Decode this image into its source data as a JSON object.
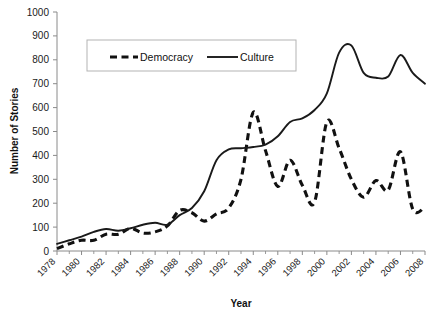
{
  "chart_data": {
    "type": "line",
    "title": "",
    "xlabel": "Year",
    "ylabel": "Number of Stories",
    "xlim": [
      1978,
      2008
    ],
    "ylim": [
      0,
      1000
    ],
    "ytick_step": 100,
    "xtick_step": 2,
    "minor_xtick_step": 1,
    "grid": false,
    "legend_position": "top-center",
    "yticks": [
      "1000",
      "900",
      "800",
      "700",
      "600",
      "500",
      "400",
      "300",
      "200",
      "100",
      "0"
    ],
    "xticks": [
      "1978",
      "1980",
      "1982",
      "1984",
      "1986",
      "1988",
      "1990",
      "1992",
      "1994",
      "1996",
      "1998",
      "2000",
      "2002",
      "2004",
      "2006",
      "2008"
    ],
    "x": [
      1978,
      1979,
      1980,
      1981,
      1982,
      1983,
      1984,
      1985,
      1986,
      1987,
      1988,
      1989,
      1990,
      1991,
      1992,
      1993,
      1994,
      1995,
      1996,
      1997,
      1998,
      1999,
      2000,
      2001,
      2002,
      2003,
      2004,
      2005,
      2006,
      2007,
      2008
    ],
    "series": [
      {
        "name": "Democracy",
        "style": "dashed",
        "color": "#111111",
        "values": [
          10,
          30,
          45,
          45,
          70,
          70,
          95,
          75,
          80,
          105,
          170,
          160,
          125,
          155,
          180,
          300,
          580,
          420,
          270,
          380,
          275,
          205,
          540,
          430,
          300,
          225,
          295,
          255,
          415,
          175,
          185
        ]
      },
      {
        "name": "Culture",
        "style": "solid",
        "color": "#1a1a1a",
        "values": [
          30,
          45,
          60,
          80,
          92,
          85,
          95,
          110,
          118,
          110,
          150,
          180,
          250,
          380,
          425,
          430,
          435,
          445,
          480,
          540,
          555,
          590,
          660,
          830,
          860,
          745,
          725,
          730,
          820,
          745,
          700
        ]
      }
    ],
    "legend": [
      {
        "label": "Democracy",
        "style": "dashed"
      },
      {
        "label": "Culture",
        "style": "solid"
      }
    ]
  }
}
